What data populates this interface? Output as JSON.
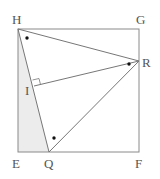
{
  "diagram": {
    "type": "geometry",
    "shape": "square EFGH with triangle HQR",
    "colors": {
      "line": "#8a8a8a",
      "shade": "#ececec",
      "dot": "#111111",
      "label": "#555555"
    },
    "points": {
      "H": {
        "label": "H",
        "x": 18,
        "y": 29
      },
      "G": {
        "label": "G",
        "x": 139,
        "y": 29
      },
      "F": {
        "label": "F",
        "x": 139,
        "y": 152
      },
      "E": {
        "label": "E",
        "x": 18,
        "y": 152
      },
      "Q": {
        "label": "Q",
        "x": 49,
        "y": 152
      },
      "R": {
        "label": "R",
        "x": 139,
        "y": 61
      },
      "I": {
        "label": "I",
        "x": 34,
        "y": 86
      }
    },
    "labels": {
      "H": "H",
      "G": "G",
      "R": "R",
      "I": "I",
      "E": "E",
      "Q": "Q",
      "F": "F"
    },
    "annotations": {
      "right_angle_at": "I",
      "shaded_region": "triangle HEQ",
      "equal_angle_marks": [
        "angle at H",
        "angle at R (IRH)",
        "angle at Q"
      ]
    }
  }
}
